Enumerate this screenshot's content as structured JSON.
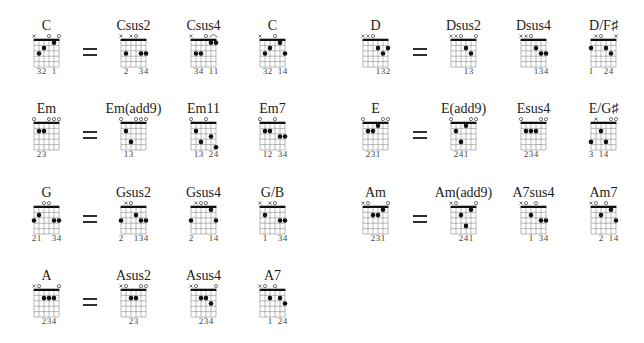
{
  "equals_symbol": "=",
  "colors": {
    "grid_line": "#8a8a8a",
    "nut": "#111111",
    "dot": "#111111",
    "marker": "#3a3a3a"
  },
  "groups": [
    {
      "root": {
        "name": "C",
        "markers": [
          "x",
          "",
          "",
          "o",
          "",
          "o"
        ],
        "dots": [
          [
            2,
            3
          ],
          [
            3,
            2
          ],
          [
            5,
            1
          ]
        ],
        "fingers": [
          "",
          "3",
          "2",
          "",
          "1",
          ""
        ]
      },
      "equivalents": [
        {
          "name": "Csus2",
          "markers": [
            "x",
            "",
            "x",
            "o",
            "",
            ""
          ],
          "dots": [
            [
              2,
              3
            ],
            [
              5,
              3
            ],
            [
              6,
              3
            ]
          ],
          "fingers": [
            "",
            "2",
            "",
            "",
            "3",
            "4"
          ]
        },
        {
          "name": "Csus4",
          "markers": [
            "x",
            "",
            "",
            "o",
            "",
            ""
          ],
          "barre": [
            5,
            6
          ],
          "dots": [
            [
              2,
              3
            ],
            [
              3,
              3
            ],
            [
              5,
              1
            ],
            [
              6,
              1
            ]
          ],
          "fingers": [
            "",
            "3",
            "4",
            "",
            "1",
            "1"
          ]
        },
        {
          "name": "C",
          "markers": [
            "x",
            "",
            "",
            "o",
            "",
            ""
          ],
          "dots": [
            [
              2,
              3
            ],
            [
              3,
              2
            ],
            [
              5,
              1
            ],
            [
              6,
              3
            ]
          ],
          "fingers": [
            "",
            "3",
            "2",
            "",
            "1",
            "4"
          ]
        }
      ]
    },
    {
      "root": {
        "name": "D",
        "markers": [
          "x",
          "x",
          "o",
          "",
          "",
          ""
        ],
        "dots": [
          [
            4,
            2
          ],
          [
            5,
            3
          ],
          [
            6,
            2
          ]
        ],
        "fingers": [
          "",
          "",
          "",
          "1",
          "3",
          "2"
        ]
      },
      "equivalents": [
        {
          "name": "Dsus2",
          "markers": [
            "x",
            "x",
            "o",
            "",
            "",
            "o"
          ],
          "dots": [
            [
              4,
              2
            ],
            [
              5,
              3
            ]
          ],
          "fingers": [
            "",
            "",
            "",
            "1",
            "3",
            ""
          ]
        },
        {
          "name": "Dsus4",
          "markers": [
            "x",
            "x",
            "o",
            "",
            "",
            ""
          ],
          "dots": [
            [
              4,
              2
            ],
            [
              5,
              3
            ],
            [
              6,
              3
            ]
          ],
          "fingers": [
            "",
            "",
            "",
            "1",
            "3",
            "4"
          ]
        },
        {
          "name": "D/F♯",
          "markers": [
            "",
            "x",
            "o",
            "",
            "",
            "x"
          ],
          "dots": [
            [
              1,
              2
            ],
            [
              4,
              2
            ],
            [
              5,
              3
            ]
          ],
          "fingers": [
            "1",
            "",
            "",
            "2",
            "4",
            ""
          ]
        }
      ]
    },
    {
      "root": {
        "name": "Em",
        "markers": [
          "o",
          "",
          "",
          "o",
          "o",
          "o"
        ],
        "dots": [
          [
            2,
            2
          ],
          [
            3,
            2
          ]
        ],
        "fingers": [
          "",
          "2",
          "3",
          "",
          "",
          ""
        ]
      },
      "equivalents": [
        {
          "name": "Em(add9)",
          "markers": [
            "o",
            "",
            "",
            "o",
            "o",
            "o"
          ],
          "dots": [
            [
              2,
              2
            ],
            [
              3,
              4
            ]
          ],
          "fingers": [
            "",
            "1",
            "3",
            "",
            "",
            ""
          ]
        },
        {
          "name": "Em11",
          "markers": [
            "o",
            "",
            "",
            "o",
            "",
            ""
          ],
          "dots": [
            [
              2,
              2
            ],
            [
              3,
              4
            ],
            [
              5,
              3
            ],
            [
              6,
              5
            ]
          ],
          "fingers": [
            "",
            "1",
            "3",
            "",
            "2",
            "4"
          ]
        },
        {
          "name": "Em7",
          "markers": [
            "o",
            "",
            "",
            "o",
            "",
            ""
          ],
          "dots": [
            [
              2,
              2
            ],
            [
              3,
              2
            ],
            [
              5,
              3
            ],
            [
              6,
              3
            ]
          ],
          "fingers": [
            "",
            "1",
            "2",
            "",
            "3",
            "4"
          ]
        }
      ]
    },
    {
      "root": {
        "name": "E",
        "markers": [
          "o",
          "",
          "",
          "",
          "o",
          "o"
        ],
        "dots": [
          [
            2,
            2
          ],
          [
            3,
            2
          ],
          [
            4,
            1
          ]
        ],
        "fingers": [
          "",
          "2",
          "3",
          "1",
          "",
          ""
        ]
      },
      "equivalents": [
        {
          "name": "E(add9)",
          "markers": [
            "o",
            "",
            "",
            "",
            "o",
            "o"
          ],
          "dots": [
            [
              2,
              2
            ],
            [
              3,
              4
            ],
            [
              4,
              1
            ]
          ],
          "fingers": [
            "",
            "2",
            "4",
            "1",
            "",
            ""
          ]
        },
        {
          "name": "Esus4",
          "markers": [
            "o",
            "",
            "",
            "",
            "o",
            "o"
          ],
          "dots": [
            [
              2,
              2
            ],
            [
              3,
              2
            ],
            [
              4,
              2
            ]
          ],
          "fingers": [
            "",
            "2",
            "3",
            "4",
            "",
            ""
          ]
        },
        {
          "name": "E/G♯",
          "markers": [
            "",
            "x",
            "",
            "",
            "o",
            "o"
          ],
          "dots": [
            [
              1,
              4
            ],
            [
              3,
              2
            ],
            [
              4,
              4
            ]
          ],
          "fingers": [
            "3",
            "",
            "1",
            "4",
            "",
            ""
          ]
        }
      ]
    },
    {
      "root": {
        "name": "G",
        "markers": [
          "",
          "",
          "o",
          "o",
          "",
          ""
        ],
        "dots": [
          [
            1,
            3
          ],
          [
            2,
            2
          ],
          [
            5,
            3
          ],
          [
            6,
            3
          ]
        ],
        "fingers": [
          "2",
          "1",
          "",
          "",
          "3",
          "4"
        ]
      },
      "equivalents": [
        {
          "name": "Gsus2",
          "markers": [
            "",
            "x",
            "o",
            "",
            "",
            ""
          ],
          "dots": [
            [
              1,
              3
            ],
            [
              4,
              2
            ],
            [
              5,
              3
            ],
            [
              6,
              3
            ]
          ],
          "fingers": [
            "2",
            "",
            "",
            "1",
            "3",
            "4"
          ]
        },
        {
          "name": "Gsus4",
          "markers": [
            "",
            "x",
            "o",
            "o",
            "",
            ""
          ],
          "dots": [
            [
              1,
              3
            ],
            [
              5,
              1
            ],
            [
              6,
              3
            ]
          ],
          "fingers": [
            "2",
            "",
            "",
            "",
            "1",
            "4"
          ]
        },
        {
          "name": "G/B",
          "markers": [
            "x",
            "",
            "x",
            "o",
            "",
            ""
          ],
          "dots": [
            [
              2,
              2
            ],
            [
              5,
              3
            ],
            [
              6,
              3
            ]
          ],
          "fingers": [
            "",
            "1",
            "",
            "",
            "3",
            "4"
          ]
        }
      ]
    },
    {
      "root": {
        "name": "Am",
        "markers": [
          "x",
          "o",
          "",
          "",
          "",
          "o"
        ],
        "dots": [
          [
            3,
            2
          ],
          [
            4,
            2
          ],
          [
            5,
            1
          ]
        ],
        "fingers": [
          "",
          "",
          "2",
          "3",
          "1",
          ""
        ]
      },
      "equivalents": [
        {
          "name": "Am(add9)",
          "markers": [
            "x",
            "o",
            "",
            "",
            "",
            "o"
          ],
          "dots": [
            [
              3,
              2
            ],
            [
              4,
              4
            ],
            [
              5,
              1
            ]
          ],
          "fingers": [
            "",
            "",
            "2",
            "4",
            "1",
            ""
          ]
        },
        {
          "name": "A7sus4",
          "markers": [
            "x",
            "o",
            "",
            "o",
            "",
            ""
          ],
          "dots": [
            [
              3,
              2
            ],
            [
              5,
              3
            ],
            [
              6,
              3
            ]
          ],
          "fingers": [
            "",
            "",
            "1",
            "",
            "3",
            "4"
          ]
        },
        {
          "name": "Am7",
          "markers": [
            "x",
            "o",
            "",
            "o",
            "",
            ""
          ],
          "dots": [
            [
              3,
              2
            ],
            [
              5,
              1
            ],
            [
              6,
              3
            ]
          ],
          "fingers": [
            "",
            "",
            "2",
            "",
            "1",
            "4"
          ]
        }
      ]
    },
    {
      "root": {
        "name": "A",
        "markers": [
          "x",
          "o",
          "",
          "",
          "",
          "o"
        ],
        "dots": [
          [
            3,
            2
          ],
          [
            4,
            2
          ],
          [
            5,
            2
          ]
        ],
        "fingers": [
          "",
          "",
          "2",
          "3",
          "4",
          ""
        ]
      },
      "equivalents": [
        {
          "name": "Asus2",
          "markers": [
            "x",
            "o",
            "",
            "",
            "o",
            "o"
          ],
          "dots": [
            [
              3,
              2
            ],
            [
              4,
              2
            ]
          ],
          "fingers": [
            "",
            "",
            "2",
            "3",
            "",
            ""
          ]
        },
        {
          "name": "Asus4",
          "markers": [
            "x",
            "o",
            "",
            "",
            "",
            "o"
          ],
          "dots": [
            [
              3,
              2
            ],
            [
              4,
              2
            ],
            [
              5,
              3
            ]
          ],
          "fingers": [
            "",
            "",
            "2",
            "3",
            "4",
            ""
          ]
        },
        {
          "name": "A7",
          "markers": [
            "x",
            "o",
            "",
            "o",
            "",
            ""
          ],
          "dots": [
            [
              3,
              2
            ],
            [
              5,
              2
            ],
            [
              6,
              3
            ]
          ],
          "fingers": [
            "",
            "",
            "1",
            "",
            "2",
            "4"
          ]
        }
      ]
    }
  ]
}
